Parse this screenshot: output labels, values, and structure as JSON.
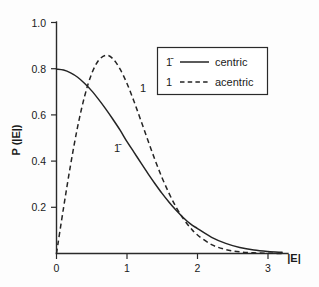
{
  "chart_data": {
    "type": "line",
    "title": "",
    "xlabel": "|E|",
    "ylabel": "P (|E|)",
    "xlim": [
      0,
      3.3
    ],
    "ylim": [
      0,
      1.0
    ],
    "xticks": [
      "0",
      "1",
      "2",
      "3"
    ],
    "xtick_values": [
      0,
      1,
      2,
      3
    ],
    "yticks": [
      "0.2",
      "0.4",
      "0.6",
      "0.8",
      "1.0"
    ],
    "ytick_values": [
      0.2,
      0.4,
      0.6,
      0.8,
      1.0
    ],
    "grid": false,
    "legend_position": "upper right",
    "series": [
      {
        "name": "centric",
        "key": "1̄",
        "style": "solid",
        "color": "#242424",
        "x": [
          0,
          0.1,
          0.2,
          0.3,
          0.4,
          0.5,
          0.6,
          0.7,
          0.8,
          0.9,
          1.0,
          1.1,
          1.2,
          1.3,
          1.4,
          1.5,
          1.6,
          1.7,
          1.8,
          1.9,
          2.0,
          2.2,
          2.4,
          2.6,
          2.8,
          3.0,
          3.2
        ],
        "values": [
          0.798,
          0.794,
          0.782,
          0.763,
          0.736,
          0.704,
          0.666,
          0.625,
          0.581,
          0.535,
          0.484,
          0.438,
          0.391,
          0.345,
          0.301,
          0.259,
          0.221,
          0.186,
          0.155,
          0.128,
          0.108,
          0.07,
          0.044,
          0.026,
          0.015,
          0.0089,
          0.0049
        ]
      },
      {
        "name": "acentric",
        "key": "1",
        "style": "dashed",
        "color": "#242424",
        "x": [
          0,
          0.1,
          0.2,
          0.3,
          0.4,
          0.5,
          0.6,
          0.707,
          0.8,
          0.9,
          1.0,
          1.1,
          1.2,
          1.3,
          1.4,
          1.5,
          1.6,
          1.7,
          1.8,
          1.9,
          2.0,
          2.2,
          2.4,
          2.6,
          2.8,
          3.0,
          3.2
        ],
        "values": [
          0.0,
          0.198,
          0.384,
          0.549,
          0.682,
          0.779,
          0.837,
          0.858,
          0.843,
          0.799,
          0.736,
          0.658,
          0.573,
          0.487,
          0.403,
          0.326,
          0.258,
          0.199,
          0.15,
          0.111,
          0.08,
          0.0386,
          0.0173,
          0.0072,
          0.0028,
          0.001,
          0.0003
        ]
      }
    ],
    "annotations": [
      {
        "text": "1̄",
        "x_data": 0.78,
        "y_data": 0.455,
        "series": "centric"
      },
      {
        "text": "1",
        "x_data": 1.12,
        "y_data": 0.725,
        "series": "acentric"
      }
    ]
  },
  "legend": {
    "entries": [
      {
        "key": "1̄",
        "label": "centric",
        "style": "solid"
      },
      {
        "key": "1",
        "label": "acentric",
        "style": "dashed"
      }
    ]
  },
  "axes": {
    "y_title": "P (|E|)",
    "x_title": "|E|"
  }
}
